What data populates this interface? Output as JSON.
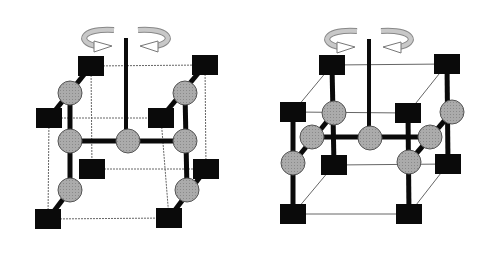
{
  "colors": {
    "background": "#ffffff",
    "square": "#0a0a0a",
    "circle": "#a8a8a8",
    "circle_stroke": "#555555",
    "thick_line": "#0a0a0a",
    "thin_line": "#666666",
    "arrow": "#c8c8c8"
  },
  "diagrams": [
    {
      "name": "left-lattice",
      "axis": {
        "x": 126,
        "y1": 38,
        "y2": 131
      },
      "squares": [
        [
          91,
          66
        ],
        [
          205,
          65
        ],
        [
          49,
          118
        ],
        [
          161,
          118
        ],
        [
          92,
          169
        ],
        [
          206,
          169
        ],
        [
          48,
          219
        ],
        [
          169,
          218
        ]
      ],
      "circles": [
        [
          70,
          93
        ],
        [
          70,
          141
        ],
        [
          70,
          190
        ],
        [
          128,
          141
        ],
        [
          185,
          93
        ],
        [
          185,
          141
        ],
        [
          187,
          190
        ]
      ],
      "thick_lines": [
        [
          49,
          118,
          91,
          66
        ],
        [
          70,
          93,
          70,
          190
        ],
        [
          48,
          219,
          70,
          190
        ],
        [
          70,
          141,
          185,
          141
        ],
        [
          161,
          118,
          205,
          65
        ],
        [
          185,
          93,
          187,
          190
        ],
        [
          169,
          218,
          206,
          169
        ]
      ],
      "thin_lines": [
        [
          91,
          66,
          205,
          65
        ],
        [
          49,
          118,
          161,
          118
        ],
        [
          92,
          169,
          206,
          169
        ],
        [
          48,
          219,
          169,
          218
        ],
        [
          49,
          118,
          48,
          219
        ],
        [
          91,
          66,
          92,
          169
        ],
        [
          161,
          118,
          169,
          218
        ],
        [
          205,
          65,
          206,
          169
        ]
      ]
    },
    {
      "name": "right-lattice",
      "axis": {
        "x": 369,
        "y1": 39,
        "y2": 129
      },
      "squares": [
        [
          332,
          65
        ],
        [
          447,
          64
        ],
        [
          293,
          112
        ],
        [
          408,
          113
        ],
        [
          334,
          165
        ],
        [
          448,
          164
        ],
        [
          293,
          214
        ],
        [
          409,
          214
        ]
      ],
      "circles": [
        [
          334,
          113
        ],
        [
          312,
          137
        ],
        [
          293,
          163
        ],
        [
          370,
          138
        ],
        [
          430,
          137
        ],
        [
          409,
          162
        ],
        [
          452,
          112
        ]
      ],
      "thick_lines": [
        [
          332,
          65,
          334,
          165
        ],
        [
          293,
          112,
          293,
          214
        ],
        [
          334,
          113,
          293,
          163
        ],
        [
          312,
          137,
          430,
          137
        ],
        [
          447,
          64,
          448,
          164
        ],
        [
          408,
          113,
          409,
          214
        ],
        [
          452,
          112,
          409,
          162
        ]
      ],
      "thin_lines": [
        [
          332,
          65,
          447,
          64
        ],
        [
          293,
          112,
          408,
          113
        ],
        [
          334,
          165,
          448,
          164
        ],
        [
          293,
          214,
          409,
          214
        ],
        [
          293,
          112,
          332,
          65
        ],
        [
          408,
          113,
          447,
          64
        ],
        [
          293,
          214,
          334,
          165
        ],
        [
          409,
          214,
          448,
          164
        ]
      ]
    }
  ]
}
